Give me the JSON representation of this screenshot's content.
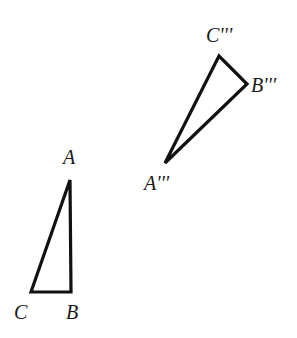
{
  "figure": {
    "stroke_color": "#111111",
    "background": "#ffffff"
  },
  "triangles": [
    {
      "name": "ABC",
      "vertices": {
        "A": {
          "label": "A",
          "x": 70,
          "y": 180,
          "label_x": 63,
          "label_y": 164
        },
        "B": {
          "label": "B",
          "x": 71,
          "y": 292,
          "label_x": 66,
          "label_y": 319
        },
        "C": {
          "label": "C",
          "x": 31,
          "y": 292,
          "label_x": 14,
          "label_y": 319
        }
      }
    },
    {
      "name": "A'''B'''C'''",
      "vertices": {
        "A": {
          "label": "A'''",
          "x": 165,
          "y": 163,
          "label_x": 144,
          "label_y": 190
        },
        "B": {
          "label": "B'''",
          "x": 247,
          "y": 84,
          "label_x": 251,
          "label_y": 92
        },
        "C": {
          "label": "C'''",
          "x": 219,
          "y": 56,
          "label_x": 206,
          "label_y": 42
        }
      }
    }
  ]
}
